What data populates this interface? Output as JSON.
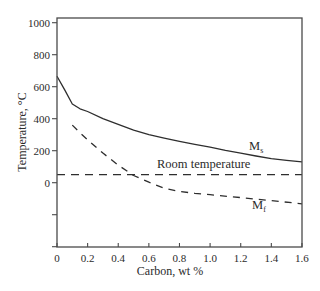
{
  "chart_data": {
    "type": "line",
    "title": "",
    "xlabel": "Carbon, wt %",
    "ylabel": "Temperature, °C",
    "xlim": [
      0,
      1.6
    ],
    "ylim": [
      -400,
      1030
    ],
    "grid": false,
    "legend": null,
    "xticks": [
      0,
      0.2,
      0.4,
      0.6,
      0.8,
      1.0,
      1.2,
      1.4,
      1.6
    ],
    "xtick_labels": [
      "0",
      "0.2",
      "0.4",
      "0.6",
      "0.8",
      "1.0",
      "1.2",
      "1.4",
      "1.6"
    ],
    "yticks": [
      -400,
      -200,
      0,
      200,
      400,
      600,
      800,
      1000
    ],
    "ytick_labels": [
      "",
      "",
      "0",
      "200",
      "400",
      "600",
      "800",
      "1000"
    ],
    "series": [
      {
        "name": "Ms",
        "style": "solid",
        "x": [
          0,
          0.05,
          0.1,
          0.15,
          0.2,
          0.3,
          0.4,
          0.5,
          0.6,
          0.7,
          0.8,
          0.9,
          1.0,
          1.1,
          1.2,
          1.3,
          1.4,
          1.5,
          1.6
        ],
        "y": [
          665,
          580,
          492,
          462,
          445,
          400,
          365,
          328,
          300,
          278,
          258,
          240,
          222,
          202,
          185,
          167,
          150,
          140,
          130
        ]
      },
      {
        "name": "Mf",
        "style": "dashed",
        "x": [
          0.1,
          0.15,
          0.2,
          0.3,
          0.4,
          0.5,
          0.6,
          0.7,
          0.8,
          0.9,
          1.0,
          1.2,
          1.4,
          1.6
        ],
        "y": [
          360,
          312,
          268,
          185,
          110,
          45,
          3,
          -35,
          -55,
          -66,
          -75,
          -93,
          -112,
          -132
        ]
      },
      {
        "name": "Room temperature",
        "style": "dashed",
        "x": [
          0,
          1.6
        ],
        "y": [
          50,
          50
        ]
      }
    ],
    "annotations": {
      "ms": {
        "main": "M",
        "sub": "s"
      },
      "mf": {
        "main": "M",
        "sub": "f"
      },
      "room": "Room temperature"
    },
    "colors": {
      "line": "#2e2e2e",
      "axis": "#4a4a4a",
      "text": "#2b2b2b",
      "background": "#ffffff"
    }
  }
}
